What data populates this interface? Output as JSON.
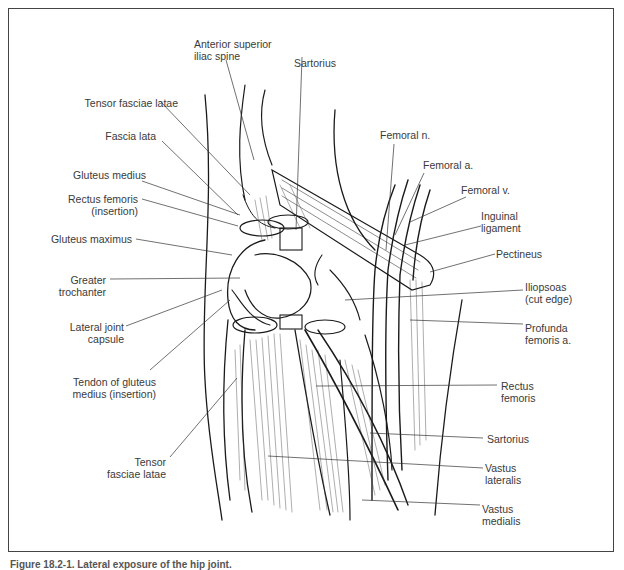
{
  "figure": {
    "caption": "Figure 18.2-1. Lateral exposure of the hip joint.",
    "colors": {
      "line": "#1a1a1a",
      "label_text": "#3a3a3a",
      "frame": "#444444",
      "background": "#ffffff"
    }
  },
  "labels": {
    "anterior_superior_iliac_spine": {
      "line1": "Anterior superior",
      "line2": "iliac spine"
    },
    "sartorius_top": {
      "line1": "Sartorius"
    },
    "tensor_fasciae_latae_top": {
      "line1": "Tensor fasciae latae"
    },
    "fascia_lata": {
      "line1": "Fascia lata"
    },
    "gluteus_medius": {
      "line1": "Gluteus medius"
    },
    "rectus_femoris_insertion": {
      "line1": "Rectus femoris",
      "line2": "(insertion)"
    },
    "gluteus_maximus": {
      "line1": "Gluteus maximus"
    },
    "greater_trochanter": {
      "line1": "Greater",
      "line2": "trochanter"
    },
    "lateral_joint_capsule": {
      "line1": "Lateral joint",
      "line2": "capsule"
    },
    "tendon_gluteus_medius": {
      "line1": "Tendon of gluteus",
      "line2": "medius (insertion)"
    },
    "tensor_fasciae_latae_bottom": {
      "line1": "Tensor",
      "line2": "fasciae latae"
    },
    "femoral_n": {
      "line1": "Femoral n."
    },
    "femoral_a": {
      "line1": "Femoral a."
    },
    "femoral_v": {
      "line1": "Femoral v."
    },
    "inguinal_ligament": {
      "line1": "Inguinal",
      "line2": "ligament"
    },
    "pectineus": {
      "line1": "Pectineus"
    },
    "iliopsoas": {
      "line1": "Iliopsoas",
      "line2": "(cut edge)"
    },
    "profunda_femoris": {
      "line1": "Profunda",
      "line2": "femoris a."
    },
    "rectus_femoris": {
      "line1": "Rectus",
      "line2": "femoris"
    },
    "sartorius_bottom": {
      "line1": "Sartorius"
    },
    "vastus_lateralis": {
      "line1": "Vastus",
      "line2": "lateralis"
    },
    "vastus_medialis": {
      "line1": "Vastus",
      "line2": "medialis"
    }
  }
}
